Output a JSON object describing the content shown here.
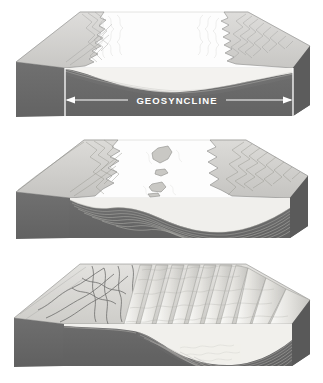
{
  "figure": {
    "background_color": "#ffffff",
    "panel_count": 3
  },
  "palette": {
    "bedrock_dark": "#6d6d6d",
    "bedrock_shadow": "#5e5e5e",
    "land_light": "#d8d8d6",
    "land_mid": "#c4c4c2",
    "sea_white": "#fdfdfd",
    "sediment_light": "#f2f1ee",
    "sediment_mid": "#dedcd7",
    "outline": "#6a6a68",
    "label_white": "#ffffff"
  },
  "annotation": {
    "label": "GEOSYNCLINE",
    "label_color": "#ffffff",
    "arrow_color": "#ffffff",
    "arrow_left_x": 65,
    "arrow_right_x": 293,
    "arrow_y": 100,
    "tick_top_y": 68,
    "tick_bottom_y": 116,
    "double_headed": true
  },
  "panels": [
    {
      "id": "panel-1",
      "stage_number": 1,
      "stage_name": "subsidence",
      "caption": "",
      "description": "Block diagram showing a shallow sea between two eroded landmasses; the bedrock floor sags downward forming the geosyncline trough.",
      "has_label": true,
      "sea_present": true,
      "islands": 0,
      "fold_ridges": 0,
      "sediment_layers": 2,
      "land_left": true,
      "land_right": true
    },
    {
      "id": "panel-2",
      "stage_number": 2,
      "stage_name": "sediment accumulation",
      "caption": "",
      "description": "The downwarped trough fills with thick stratified sediments; small islands emerge in the center of the sea.",
      "has_label": false,
      "sea_present": true,
      "islands": 4,
      "fold_ridges": 0,
      "sediment_layers": 8,
      "land_left": true,
      "land_right": true
    },
    {
      "id": "panel-3",
      "stage_number": 3,
      "stage_name": "folding and uplift",
      "caption": "",
      "description": "Compression folds the sediment pile into parallel mountain ridges; the left plateau is fractured by faults and the sea has withdrawn.",
      "has_label": false,
      "sea_present": false,
      "islands": 0,
      "fold_ridges": 9,
      "sediment_layers": 9,
      "land_left": true,
      "land_right": true
    }
  ]
}
